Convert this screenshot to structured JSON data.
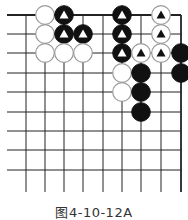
{
  "caption": "图4-10-12A",
  "board": {
    "columns_x": [
      26,
      45,
      64,
      83,
      103,
      122,
      141,
      161,
      181
    ],
    "rows_y": [
      15,
      34,
      53,
      73,
      92,
      112,
      131,
      150,
      170
    ],
    "line_left": 7,
    "line_bottom": 192,
    "line_color": "#222222",
    "edges": [
      "top",
      "right"
    ]
  },
  "stones": [
    {
      "color": "white",
      "col": 1,
      "row": 0,
      "mark": false
    },
    {
      "color": "black",
      "col": 2,
      "row": 0,
      "mark": true
    },
    {
      "color": "black",
      "col": 5,
      "row": 0,
      "mark": true
    },
    {
      "color": "white",
      "col": 7,
      "row": 0,
      "mark": true
    },
    {
      "color": "white",
      "col": 1,
      "row": 1,
      "mark": false
    },
    {
      "color": "black",
      "col": 2,
      "row": 1,
      "mark": true
    },
    {
      "color": "black",
      "col": 3,
      "row": 1,
      "mark": true
    },
    {
      "color": "black",
      "col": 5,
      "row": 1,
      "mark": true
    },
    {
      "color": "white",
      "col": 7,
      "row": 1,
      "mark": true
    },
    {
      "color": "white",
      "col": 1,
      "row": 2,
      "mark": false
    },
    {
      "color": "white",
      "col": 2,
      "row": 2,
      "mark": false
    },
    {
      "color": "white",
      "col": 3,
      "row": 2,
      "mark": false
    },
    {
      "color": "black",
      "col": 5,
      "row": 2,
      "mark": true
    },
    {
      "color": "white",
      "col": 6,
      "row": 2,
      "mark": true
    },
    {
      "color": "white",
      "col": 7,
      "row": 2,
      "mark": true
    },
    {
      "color": "black",
      "col": 8,
      "row": 2,
      "mark": false
    },
    {
      "color": "white",
      "col": 5,
      "row": 3,
      "mark": false
    },
    {
      "color": "black",
      "col": 6,
      "row": 3,
      "mark": false
    },
    {
      "color": "black",
      "col": 8,
      "row": 3,
      "mark": false
    },
    {
      "color": "white",
      "col": 5,
      "row": 4,
      "mark": false
    },
    {
      "color": "black",
      "col": 6,
      "row": 4,
      "mark": false
    },
    {
      "color": "black",
      "col": 6,
      "row": 5,
      "mark": false
    }
  ]
}
